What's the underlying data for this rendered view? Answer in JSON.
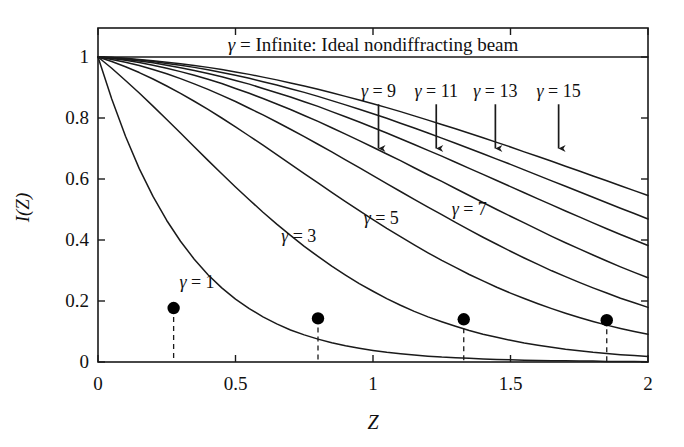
{
  "chart_data": {
    "type": "line",
    "title": "",
    "xlabel": "Z",
    "ylabel": "I(Z)",
    "xlim": [
      0,
      2
    ],
    "ylim": [
      0,
      1
    ],
    "xticks": [
      "0",
      "0.5",
      "1",
      "1.5",
      "2"
    ],
    "xtick_values": [
      0,
      0.5,
      1,
      1.5,
      2
    ],
    "yticks": [
      "0",
      "0.2",
      "0.4",
      "0.6",
      "0.8",
      "1"
    ],
    "ytick_values": [
      0,
      0.2,
      0.4,
      0.6,
      0.8,
      1
    ],
    "grid": false,
    "legend_position": "inline-annotations",
    "banner_text": "γ = Infinite: Ideal nondiffracting beam",
    "banner_gamma_symbol": "γ",
    "banner_rest": " = Infinite: Ideal nondiffracting beam",
    "x": [
      0,
      0.05,
      0.1,
      0.15,
      0.2,
      0.25,
      0.3,
      0.35,
      0.4,
      0.45,
      0.5,
      0.55,
      0.6,
      0.65,
      0.7,
      0.75,
      0.8,
      0.85,
      0.9,
      0.95,
      1,
      1.05,
      1.1,
      1.15,
      1.2,
      1.25,
      1.3,
      1.35,
      1.4,
      1.45,
      1.5,
      1.55,
      1.6,
      1.65,
      1.7,
      1.75,
      1.8,
      1.85,
      1.9,
      1.95,
      2
    ],
    "series": [
      {
        "name": "γ = Infinite",
        "gamma": "Infinite",
        "label": "γ = Infinite: Ideal nondiffracting beam",
        "values": [
          1,
          1,
          1,
          1,
          1,
          1,
          1,
          1,
          1,
          1,
          1,
          1,
          1,
          1,
          1,
          1,
          1,
          1,
          1,
          1,
          1,
          1,
          1,
          1,
          1,
          1,
          1,
          1,
          1,
          1,
          1,
          1,
          1,
          1,
          1,
          1,
          1,
          1,
          1,
          1,
          1
        ]
      },
      {
        "name": "γ = 1",
        "gamma": "1",
        "label": "γ = 1",
        "values": [
          1,
          0.862,
          0.74,
          0.634,
          0.543,
          0.464,
          0.396,
          0.337,
          0.286,
          0.243,
          0.206,
          0.175,
          0.148,
          0.125,
          0.105,
          0.089,
          0.075,
          0.063,
          0.053,
          0.045,
          0.038,
          0.032,
          0.027,
          0.023,
          0.019,
          0.016,
          0.014,
          0.012,
          0.01,
          0.008,
          0.007,
          0.006,
          0.005,
          0.004,
          0.004,
          0.003,
          0.003,
          0.002,
          0.002,
          0.002,
          0.001
        ]
      },
      {
        "name": "γ = 3",
        "gamma": "3",
        "label": "γ = 3",
        "values": [
          1,
          0.963,
          0.923,
          0.882,
          0.839,
          0.795,
          0.751,
          0.706,
          0.661,
          0.617,
          0.574,
          0.532,
          0.491,
          0.452,
          0.415,
          0.379,
          0.346,
          0.314,
          0.285,
          0.257,
          0.232,
          0.208,
          0.186,
          0.166,
          0.148,
          0.132,
          0.117,
          0.103,
          0.091,
          0.081,
          0.071,
          0.062,
          0.055,
          0.048,
          0.042,
          0.037,
          0.032,
          0.028,
          0.024,
          0.021,
          0.018
        ]
      },
      {
        "name": "γ = 5",
        "gamma": "5",
        "label": "γ = 5",
        "values": [
          1,
          0.985,
          0.968,
          0.949,
          0.928,
          0.905,
          0.881,
          0.855,
          0.828,
          0.8,
          0.771,
          0.741,
          0.711,
          0.68,
          0.649,
          0.618,
          0.587,
          0.556,
          0.526,
          0.496,
          0.467,
          0.438,
          0.411,
          0.384,
          0.358,
          0.333,
          0.31,
          0.287,
          0.266,
          0.245,
          0.226,
          0.208,
          0.191,
          0.175,
          0.16,
          0.146,
          0.133,
          0.121,
          0.11,
          0.1,
          0.091
        ]
      },
      {
        "name": "γ = 7",
        "gamma": "7",
        "label": "γ = 7",
        "values": [
          1,
          0.992,
          0.983,
          0.972,
          0.959,
          0.945,
          0.929,
          0.912,
          0.894,
          0.874,
          0.854,
          0.832,
          0.81,
          0.787,
          0.763,
          0.739,
          0.714,
          0.689,
          0.663,
          0.637,
          0.611,
          0.585,
          0.559,
          0.533,
          0.508,
          0.483,
          0.458,
          0.433,
          0.409,
          0.386,
          0.363,
          0.341,
          0.32,
          0.299,
          0.28,
          0.261,
          0.243,
          0.226,
          0.209,
          0.194,
          0.179
        ]
      },
      {
        "name": "γ = 9",
        "gamma": "9",
        "label": "γ = 9",
        "values": [
          1,
          0.995,
          0.989,
          0.982,
          0.973,
          0.963,
          0.952,
          0.94,
          0.927,
          0.913,
          0.897,
          0.881,
          0.864,
          0.846,
          0.828,
          0.808,
          0.789,
          0.768,
          0.747,
          0.726,
          0.704,
          0.682,
          0.66,
          0.637,
          0.614,
          0.592,
          0.569,
          0.546,
          0.523,
          0.5,
          0.478,
          0.456,
          0.434,
          0.412,
          0.391,
          0.371,
          0.351,
          0.331,
          0.312,
          0.294,
          0.276
        ]
      },
      {
        "name": "γ = 11",
        "gamma": "11",
        "label": "γ = 11",
        "values": [
          1,
          0.997,
          0.992,
          0.987,
          0.981,
          0.973,
          0.965,
          0.956,
          0.946,
          0.935,
          0.923,
          0.911,
          0.897,
          0.883,
          0.869,
          0.853,
          0.838,
          0.821,
          0.804,
          0.787,
          0.769,
          0.751,
          0.732,
          0.713,
          0.694,
          0.675,
          0.655,
          0.635,
          0.615,
          0.595,
          0.575,
          0.555,
          0.535,
          0.515,
          0.495,
          0.476,
          0.456,
          0.437,
          0.418,
          0.4,
          0.382
        ]
      },
      {
        "name": "γ = 13",
        "gamma": "13",
        "label": "γ = 13",
        "values": [
          1,
          0.998,
          0.994,
          0.99,
          0.985,
          0.979,
          0.973,
          0.966,
          0.958,
          0.949,
          0.94,
          0.93,
          0.919,
          0.908,
          0.896,
          0.884,
          0.871,
          0.857,
          0.843,
          0.829,
          0.814,
          0.799,
          0.783,
          0.767,
          0.751,
          0.734,
          0.717,
          0.7,
          0.683,
          0.665,
          0.648,
          0.63,
          0.612,
          0.594,
          0.576,
          0.558,
          0.54,
          0.522,
          0.504,
          0.487,
          0.469
        ]
      },
      {
        "name": "γ = 15",
        "gamma": "15",
        "label": "γ = 15",
        "values": [
          1,
          0.998,
          0.996,
          0.992,
          0.988,
          0.983,
          0.978,
          0.972,
          0.966,
          0.959,
          0.951,
          0.943,
          0.934,
          0.925,
          0.915,
          0.905,
          0.894,
          0.883,
          0.871,
          0.859,
          0.847,
          0.834,
          0.821,
          0.807,
          0.793,
          0.779,
          0.765,
          0.75,
          0.735,
          0.72,
          0.705,
          0.689,
          0.674,
          0.658,
          0.642,
          0.626,
          0.61,
          0.594,
          0.578,
          0.562,
          0.546
        ]
      }
    ],
    "markers": [
      {
        "name": "marker-gamma-1",
        "x": 0.275,
        "y": 0.177,
        "label": "",
        "dropline": true
      },
      {
        "name": "marker-gamma-3",
        "x": 0.8,
        "y": 0.143,
        "label": "",
        "dropline": true
      },
      {
        "name": "marker-gamma-5",
        "x": 1.33,
        "y": 0.14,
        "label": "",
        "dropline": true
      },
      {
        "name": "marker-gamma-7",
        "x": 1.85,
        "y": 0.137,
        "label": "",
        "dropline": true
      }
    ],
    "inline_annotations": [
      {
        "name": "label-gamma-1",
        "text": "γ = 1",
        "gamma_symbol": "γ",
        "rest": " = 1",
        "x": 0.36,
        "y": 0.26
      },
      {
        "name": "label-gamma-3",
        "text": "γ = 3",
        "gamma_symbol": "γ",
        "rest": " = 3",
        "x": 0.73,
        "y": 0.41
      },
      {
        "name": "label-gamma-5",
        "text": "γ = 5",
        "gamma_symbol": "γ",
        "rest": " = 5",
        "x": 1.03,
        "y": 0.47
      },
      {
        "name": "label-gamma-7",
        "text": "γ = 7",
        "gamma_symbol": "γ",
        "rest": " = 7",
        "x": 1.35,
        "y": 0.5
      }
    ],
    "arrow_annotations": [
      {
        "name": "label-gamma-9",
        "text": "γ = 9",
        "gamma_symbol": "γ",
        "rest": " = 9",
        "x": 1.02,
        "label_y": 0.885,
        "arrow_from_y": 0.845,
        "arrow_to_y": 0.7
      },
      {
        "name": "label-gamma-11",
        "text": "γ = 11",
        "gamma_symbol": "γ",
        "rest": " = 11",
        "x": 1.23,
        "label_y": 0.885,
        "arrow_from_y": 0.845,
        "arrow_to_y": 0.7
      },
      {
        "name": "label-gamma-13",
        "text": "γ = 13",
        "gamma_symbol": "γ",
        "rest": " = 13",
        "x": 1.445,
        "label_y": 0.885,
        "arrow_from_y": 0.845,
        "arrow_to_y": 0.7
      },
      {
        "name": "label-gamma-15",
        "text": "γ = 15",
        "gamma_symbol": "γ",
        "rest": " = 15",
        "x": 1.675,
        "label_y": 0.885,
        "arrow_from_y": 0.845,
        "arrow_to_y": 0.7
      }
    ],
    "colors": {
      "curve": "#1a1a1a",
      "axis": "#1a1a1a",
      "marker": "#000000",
      "dashed": "#1a1a1a",
      "background": "#ffffff"
    }
  }
}
